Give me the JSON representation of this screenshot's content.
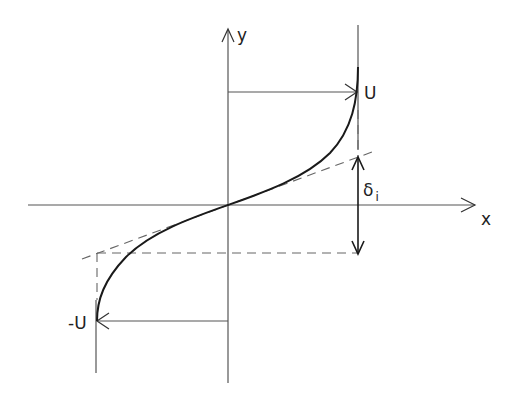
{
  "diagram": {
    "type": "velocity-profile-sketch",
    "axes": {
      "x_label": "x",
      "y_label": "y"
    },
    "labels": {
      "upper_velocity": "U",
      "lower_velocity": "-U",
      "thickness": "δ",
      "thickness_subscript": "i"
    },
    "colors": {
      "line": "#555555",
      "curve": "#1a1a1a",
      "background": "#ffffff"
    }
  }
}
